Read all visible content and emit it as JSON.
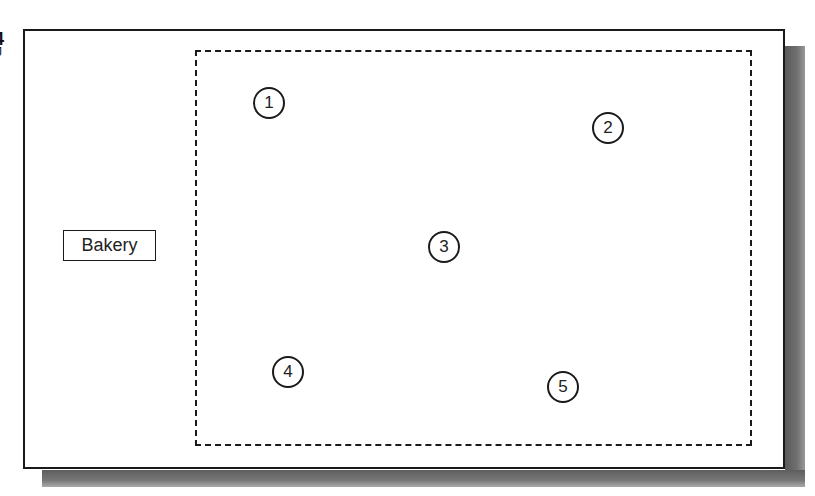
{
  "edge_labels": [
    "4",
    "J"
  ],
  "diagram": {
    "outer_frame": {
      "stroke": "#1a1a1a",
      "fill": "#ffffff",
      "shadow_color": "#6e6e6e"
    },
    "boundary": {
      "style": "dashed",
      "stroke": "#1a1a1a"
    },
    "label": "Bakery",
    "markers": [
      {
        "id": "1",
        "label": "1",
        "cx": 269,
        "cy": 103
      },
      {
        "id": "2",
        "label": "2",
        "cx": 608,
        "cy": 128
      },
      {
        "id": "3",
        "label": "3",
        "cx": 444,
        "cy": 247
      },
      {
        "id": "4",
        "label": "4",
        "cx": 288,
        "cy": 372
      },
      {
        "id": "5",
        "label": "5",
        "cx": 563,
        "cy": 387
      }
    ]
  }
}
